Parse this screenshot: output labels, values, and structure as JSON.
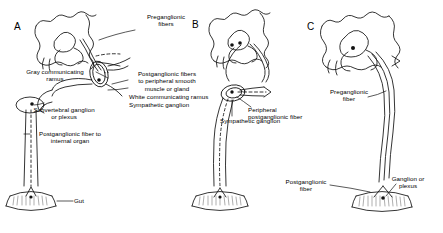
{
  "figure": {
    "background_color": "#ffffff",
    "ink_color": "#000000",
    "panel_count": 3
  },
  "panels": [
    {
      "letter": "A",
      "labels": {
        "preganglionic_fibers": "Preganglionic\nfibers",
        "gray_communicating_ramus": "Gray communicating\nramus",
        "postganglionic_peripheral": "Postganglionic fibers\nto peripheral smooth\nmuscle or gland",
        "white_communicating_ramus": "White communicating ramus",
        "sympathetic_ganglion": "Sympathetic ganglion",
        "subvertebral_ganglion": "Subvertebral ganglion\nor plexus",
        "postganglionic_internal": "Postganglionic fiber to\ninternal organ",
        "gut": "Gut"
      }
    },
    {
      "letter": "B",
      "labels": {
        "peripheral_postganglionic_fiber": "Peripheral\npostganglionic fiber",
        "sympathetic_ganglion": "Sympathetic ganglion"
      }
    },
    {
      "letter": "C",
      "labels": {
        "preganglionic_fiber": "Preganglionic\nfiber",
        "postganglionic_fiber": "Postganglionic\nfiber",
        "ganglion_or_plexus": "Ganglion or\nplexus"
      }
    }
  ]
}
